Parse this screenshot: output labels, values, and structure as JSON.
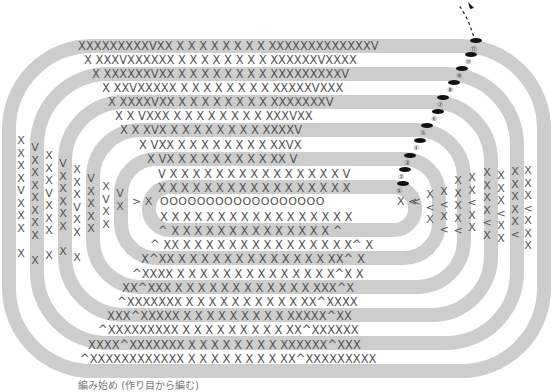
{
  "diagram": {
    "type": "crochet-oval-chart",
    "legend_symbols": {
      "X": "single-crochet",
      "V": "increase (2 sc in one stitch)",
      "^": "decrease",
      "O": "chain",
      "marker": "slip-stitch / join"
    },
    "top_rows": [
      {
        "num": "⑪",
        "text": "XXXXXXXXXVXX X X X X X X X X XXXXXXXXXXXXXV"
      },
      {
        "num": "⑩",
        "text": "X XXXVXXXXXX X X X X X X X X XXXXXXVXXXX"
      },
      {
        "num": "⑨",
        "text": "X XXXXXXVXX X X X X X X X X XXXXXXXXXV"
      },
      {
        "num": "⑧",
        "text": "X XXVXXXXX X X X X X X X X XXXXXVXXX"
      },
      {
        "num": "⑦",
        "text": "X XXXXVXX X X X X X X X X XXXXXXXV"
      },
      {
        "num": "⑥",
        "text": "X X VXXX X X X X X X X X XXXVXX"
      },
      {
        "num": "⑤",
        "text": "X X XVX X X X X X X X X XXXXV"
      },
      {
        "num": "④",
        "text": "X VXX X X X X X X X X XXVX"
      },
      {
        "num": "③",
        "text": "X VX X X X X X X X X XX V"
      },
      {
        "num": "②",
        "text": "V X X X X X X X X X X X X X X X V"
      },
      {
        "num": "①",
        "text": "X X X X X X X X X X X X X X X X X"
      }
    ],
    "foundation_chain": {
      "start": "> X",
      "chain": "OOOOOOOOOOOOOOOOOO",
      "end": "X <"
    },
    "bottom_rows": [
      "X X X X X X X X X X X X X X X X X",
      "^ X X X X X X X X X X X X X X ^",
      "^ XX X X X X X X X X X X X X X X X^ X",
      "X^XX X X X X X X X X X X X X X XX^ X",
      "^XXXX X X X X X X X X X X X X X X^X X",
      "XX^XXX X X X X X X X X X X X X XXX^X",
      "^XXXXXXX X X X X X X X X X X XX^XXXX",
      "XXX^XXXXX X X X X X X X X X XXXXX^XX",
      "^XXXXXXXXX X X X X X X X X X XX^XXXXXX",
      "XXXX^XXXXXXX X X X X X X X X XXXXXX^XXX",
      "^XXXXXXXXXXXX X X X X X X X X XX^XXXXXXXXX"
    ],
    "left_columns": [
      "X\nX\nX\nX\nV\nX\nX\nX\n\nX",
      "V\nX\nX\nX\nX\nX\nX\nX\n\nX",
      "X\nX\nX\nV\nX\nX\nX\n\nX",
      "V\nX\nX\nX\nX\nX\n\nX",
      "X\nX\nX\nV\nX\nX\n\nX",
      "V\nX\nX\nX\nX",
      "X\nV\nX\nX",
      "V\nX",
      ">"
    ],
    "right_columns": [
      "<",
      "X\n<\nX",
      "X\n<\nX\n<",
      "X\nX\nX\nX\n<",
      "X\nX\n<\nX\nX",
      "X\nX\nX\nX\n<\nX",
      "X\nX\nX\n<\nX\nX",
      "X\nX\nX\nX\nX\n<",
      "X\nX\nX\n<\nX\nX\nX"
    ],
    "caption": "編み始め (作り目から編む)",
    "colors": {
      "band": "#cdcdcd",
      "symbol": "#555555",
      "marker": "#111111",
      "background": "#ffffff"
    }
  }
}
